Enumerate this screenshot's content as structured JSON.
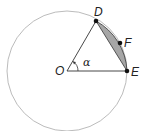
{
  "diagram": {
    "type": "circle-sector-segment",
    "circle": {
      "center_label": "O",
      "cx": 67,
      "cy": 71,
      "r": 60
    },
    "points": [
      {
        "label": "D",
        "x": 96,
        "y": 21
      },
      {
        "label": "F",
        "x": 120,
        "y": 43
      },
      {
        "label": "E",
        "x": 127,
        "y": 71
      }
    ],
    "angle_label": "α",
    "shaded_region": "circular segment between chord DE and arc DFE",
    "colors": {
      "circle": "#aaaaaa",
      "lines": "#333333",
      "shade": "#a6a6a6",
      "points": "#111111"
    }
  },
  "labels": {
    "O": "O",
    "D": "D",
    "E": "E",
    "F": "F",
    "alpha": "α"
  }
}
